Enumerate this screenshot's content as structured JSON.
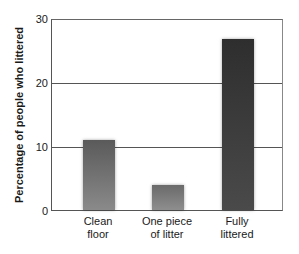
{
  "chart_data": {
    "type": "bar",
    "title": "",
    "xlabel": "",
    "ylabel": "Percentage of people who littered",
    "categories": [
      "Clean floor",
      "One piece of litter",
      "Fully littered"
    ],
    "category_lines": [
      [
        "Clean",
        "floor"
      ],
      [
        "One piece",
        "of litter"
      ],
      [
        "Fully",
        "littered"
      ]
    ],
    "values": [
      11,
      4,
      27
    ],
    "ylim": [
      0,
      30
    ],
    "yticks": [
      0,
      10,
      20,
      30
    ],
    "grid": true,
    "legend": null
  },
  "colors": {
    "bar_top": [
      "#5a5a5a",
      "#6a6a6a",
      "#2e2e2e"
    ],
    "bar_bottom": [
      "#8a8a8a",
      "#8e8e8e",
      "#4a4a4a"
    ],
    "axis": "#555555"
  }
}
